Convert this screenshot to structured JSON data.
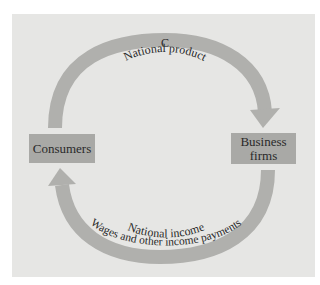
{
  "diagram": {
    "nodes": {
      "consumers": "Consumers",
      "business_firms_line1": "Business",
      "business_firms_line2": "firms"
    },
    "top_flow": {
      "label_c": "C",
      "label": "National product",
      "direction": "Consumers to Business firms"
    },
    "bottom_flow": {
      "label_inner": "National income",
      "label_outer": "Wages and other income payments",
      "direction": "Business firms to Consumers"
    },
    "colors": {
      "background": "#e6e6e4",
      "arrow": "#b0b0ad",
      "box": "#a9a9a6",
      "text": "#2a2a2a"
    }
  }
}
